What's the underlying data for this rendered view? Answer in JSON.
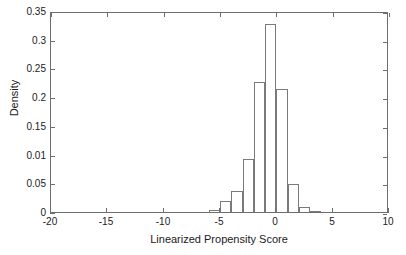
{
  "chart_data": {
    "type": "bar",
    "title": "",
    "subtitle": "",
    "xlabel": "Linearized Propensity Score",
    "ylabel": "Density",
    "xlim": [
      -20,
      10
    ],
    "ylim": [
      0,
      0.35
    ],
    "grid": false,
    "legend": null,
    "bin_width": 1,
    "xtick_values": [
      -20,
      -15,
      -10,
      -5,
      0,
      5,
      10
    ],
    "xtick_labels": [
      "-20",
      "-15",
      "-10",
      "-5",
      "0",
      "5",
      "10"
    ],
    "ytick_values": [
      0,
      0.05,
      0.1,
      0.15,
      0.2,
      0.25,
      0.3,
      0.35
    ],
    "ytick_labels": [
      "0",
      "0.05",
      "0.01",
      "0.15",
      "0.2",
      "0.25",
      "0.3",
      "0.35"
    ],
    "bars": [
      {
        "label": "-6 to -5",
        "x0": -6,
        "x1": -5,
        "value": 0.003
      },
      {
        "label": "-5 to -4",
        "x0": -5,
        "x1": -4,
        "value": 0.02
      },
      {
        "label": "-4 to -3",
        "x0": -4,
        "x1": -3,
        "value": 0.036
      },
      {
        "label": "-3 to -2",
        "x0": -3,
        "x1": -2,
        "value": 0.093
      },
      {
        "label": "-2 to -1",
        "x0": -2,
        "x1": -1,
        "value": 0.227
      },
      {
        "label": "-1 to 0",
        "x0": -1,
        "x1": 0,
        "value": 0.328
      },
      {
        "label": "0 to 1",
        "x0": 0,
        "x1": 1,
        "value": 0.215
      },
      {
        "label": "1 to 2",
        "x0": 1,
        "x1": 2,
        "value": 0.049
      },
      {
        "label": "2 to 3",
        "x0": 2,
        "x1": 3,
        "value": 0.008
      },
      {
        "label": "3 to 4",
        "x0": 3,
        "x1": 4,
        "value": 0.002
      }
    ],
    "categories": [
      "-6 to -5",
      "-5 to -4",
      "-4 to -3",
      "-3 to -2",
      "-2 to -1",
      "-1 to 0",
      "0 to 1",
      "1 to 2",
      "2 to 3",
      "3 to 4"
    ],
    "values": [
      0.003,
      0.02,
      0.036,
      0.093,
      0.227,
      0.328,
      0.215,
      0.049,
      0.008,
      0.002
    ],
    "colors": {
      "bar_fill": "#ffffff",
      "bar_edge": "#7a7a7a",
      "axis": "#6e6e6e",
      "text": "#1a1a1a",
      "background": "#ffffff"
    }
  }
}
